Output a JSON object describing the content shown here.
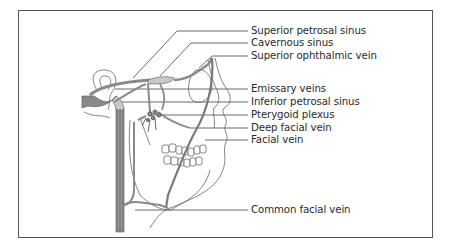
{
  "figure": {
    "colors": {
      "vein_fill": "#8a8a8a",
      "vein_light": "#c8c8c8",
      "outline": "#555555",
      "leader": "#444444",
      "text": "#2a2a2a"
    },
    "labels": [
      {
        "id": "superior-petrosal-sinus",
        "text": "Superior petrosal sinus",
        "y": 31
      },
      {
        "id": "cavernous-sinus",
        "text": "Cavernous sinus",
        "y": 43
      },
      {
        "id": "superior-ophthalmic-vein",
        "text": "Superior ophthalmic vein",
        "y": 56
      },
      {
        "id": "emissary-veins",
        "text": "Emissary veins",
        "y": 89
      },
      {
        "id": "inferior-petrosal-sinus",
        "text": "Inferior petrosal sinus",
        "y": 102
      },
      {
        "id": "pterygoid-plexus",
        "text": "Pterygoid plexus",
        "y": 115
      },
      {
        "id": "deep-facial-vein",
        "text": "Deep facial vein",
        "y": 128
      },
      {
        "id": "facial-vein",
        "text": "Facial vein",
        "y": 140
      },
      {
        "id": "common-facial-vein",
        "text": "Common facial vein",
        "y": 210
      }
    ]
  }
}
